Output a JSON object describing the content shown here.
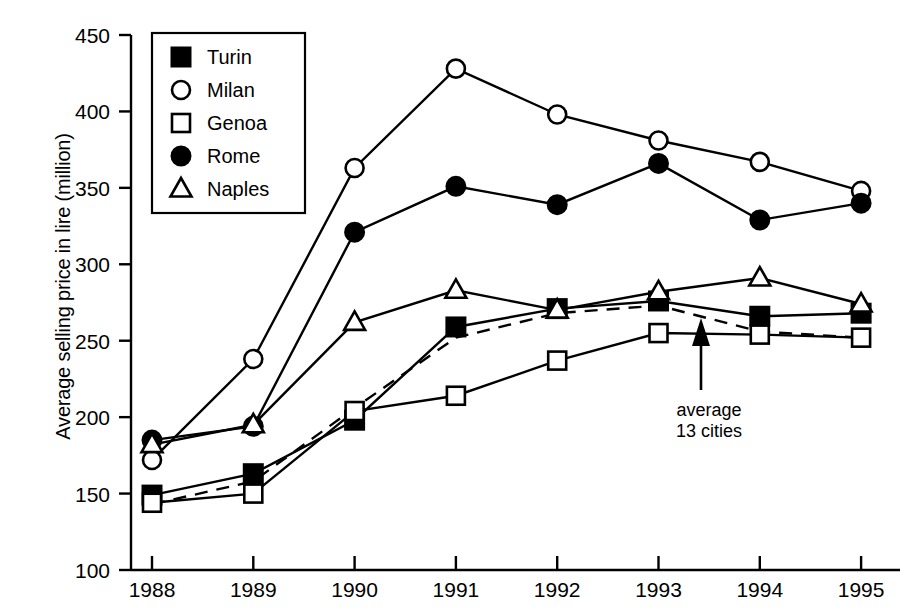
{
  "chart_data": {
    "type": "line",
    "title": "",
    "subtitle": "",
    "xlabel": "",
    "ylabel": "Average selling price in lire (million)",
    "categories": [
      "1988",
      "1989",
      "1990",
      "1991",
      "1992",
      "1993",
      "1994",
      "1995"
    ],
    "x_tick_labels": [
      "1988",
      "1989",
      "1990",
      "1991",
      "1992",
      "1993",
      "1994",
      "1995"
    ],
    "y_tick_labels": [
      "100",
      "150",
      "200",
      "250",
      "300",
      "350",
      "400",
      "450"
    ],
    "y_ticks": [
      100,
      150,
      200,
      250,
      300,
      350,
      400,
      450
    ],
    "ylim": [
      100,
      450
    ],
    "grid": false,
    "legend_position": "top-left-inside",
    "series": [
      {
        "name": "Turin",
        "marker": "filled-square",
        "line": "solid",
        "values": [
          149,
          163,
          198,
          259,
          271,
          276,
          266,
          268
        ]
      },
      {
        "name": "Milan",
        "marker": "open-circle",
        "line": "solid",
        "values": [
          172,
          238,
          363,
          428,
          398,
          381,
          367,
          348
        ]
      },
      {
        "name": "Genoa",
        "marker": "open-square",
        "line": "solid",
        "values": [
          144,
          150,
          204,
          214,
          237,
          255,
          254,
          252
        ]
      },
      {
        "name": "Rome",
        "marker": "filled-circle",
        "line": "solid",
        "values": [
          185,
          194,
          321,
          351,
          339,
          366,
          329,
          340
        ]
      },
      {
        "name": "Naples",
        "marker": "open-triangle",
        "line": "solid",
        "values": [
          182,
          195,
          262,
          283,
          270,
          282,
          291,
          274
        ]
      },
      {
        "name": "average 13 cities",
        "marker": "none",
        "line": "dashed",
        "values": [
          143,
          158,
          206,
          252,
          268,
          273,
          256,
          252
        ]
      }
    ],
    "annotations": [
      {
        "text_line1": "average",
        "text_line2": "13 cities",
        "points_to_series": "average 13 cities",
        "arrow": "up"
      }
    ],
    "legend_entries": [
      "Turin",
      "Milan",
      "Genoa",
      "Rome",
      "Naples"
    ]
  },
  "axis": {
    "ylabel": "Average selling price in lire (million)"
  },
  "annotation": {
    "line1": "average",
    "line2": "13 cities"
  },
  "colors": {
    "ink": "#000000",
    "background": "#ffffff"
  }
}
